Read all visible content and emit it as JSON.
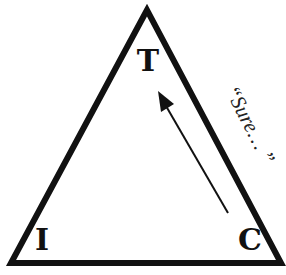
{
  "diagram": {
    "type": "triangle",
    "vertices": {
      "top": {
        "label": "T"
      },
      "bottom_left": {
        "label": "I"
      },
      "bottom_right": {
        "label": "C"
      }
    },
    "arrow": {
      "from": "C",
      "to": "T"
    },
    "side_label": "“Sure… ”",
    "colors": {
      "stroke": "#111111",
      "background": "#ffffff"
    }
  }
}
